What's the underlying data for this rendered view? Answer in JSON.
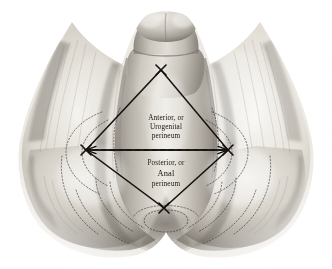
{
  "figure": {
    "kind": "anatomical-illustration",
    "medium": "grayscale halftone engraving",
    "background_color": "#ffffff",
    "ink_color": "#191512",
    "paper_tone": "#e8e5de"
  },
  "labels": {
    "anterior": {
      "line1": "Anterior, or",
      "line2": "Urogenital",
      "line3": "perineum"
    },
    "posterior": {
      "line1": "Posterior, or",
      "line2": "Anal",
      "line3": "perineum"
    }
  },
  "overlay": {
    "marker_glyph": "X",
    "diamond_vertices": {
      "top": {
        "x": 161,
        "y": 70
      },
      "left": {
        "x": 86,
        "y": 150
      },
      "right": {
        "x": 228,
        "y": 150
      },
      "bottom": {
        "x": 164,
        "y": 208
      }
    },
    "transverse_line": {
      "style": "dashed",
      "arrowheads": "both",
      "from": {
        "x": 86,
        "y": 150
      },
      "to": {
        "x": 228,
        "y": 150
      }
    },
    "solid_line_style": "solid",
    "dotted_contour_style": "dotted"
  }
}
